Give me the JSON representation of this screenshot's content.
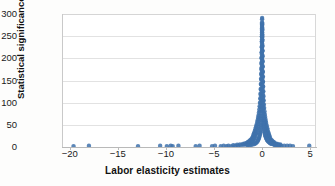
{
  "chart_data": {
    "type": "scatter",
    "title": "",
    "xlabel": "Labor elasticity estimates",
    "ylabel": "Statistical significance (1/Se)",
    "xlim": [
      -20.8,
      5.6
    ],
    "ylim": [
      0,
      300
    ],
    "xticks": [
      -20,
      -15,
      -10,
      -5,
      0,
      5
    ],
    "xticklabels": [
      "−20",
      "−15",
      "−10",
      "−5",
      "0",
      "5"
    ],
    "yticks": [
      0,
      50,
      100,
      150,
      200,
      250,
      300
    ],
    "yticklabels": [
      "0",
      "50",
      "100",
      "150",
      "200",
      "250",
      "300"
    ],
    "grid": "horizontal",
    "legend": "none",
    "marker_color": "#3f72ab",
    "marker_size": 2.2,
    "series": [
      {
        "name": "study estimates",
        "comment": "funnel plot: dense near-zero spike plus sparse negative outliers",
        "points": [
          [
            -19.6,
            2
          ],
          [
            -18.0,
            3
          ],
          [
            -12.9,
            2
          ],
          [
            -10.6,
            3
          ],
          [
            -9.9,
            2
          ],
          [
            -9.5,
            3
          ],
          [
            -9.3,
            2
          ],
          [
            -8.7,
            3
          ],
          [
            -6.9,
            2
          ],
          [
            -6.5,
            3
          ],
          [
            -5.2,
            2
          ],
          [
            -4.9,
            3
          ],
          [
            -4.3,
            2
          ],
          [
            -4.0,
            3
          ],
          [
            -3.7,
            2
          ],
          [
            -3.5,
            3
          ],
          [
            -3.2,
            2
          ],
          [
            -3.0,
            4
          ],
          [
            -2.8,
            3
          ],
          [
            -2.6,
            5
          ],
          [
            -2.5,
            3
          ],
          [
            -2.3,
            6
          ],
          [
            -2.2,
            4
          ],
          [
            -2.0,
            7
          ],
          [
            -1.9,
            5
          ],
          [
            -1.8,
            8
          ],
          [
            -1.7,
            6
          ],
          [
            -1.6,
            9
          ],
          [
            -1.55,
            5
          ],
          [
            -1.5,
            11
          ],
          [
            -1.45,
            7
          ],
          [
            -1.4,
            12
          ],
          [
            -1.35,
            8
          ],
          [
            -1.3,
            14
          ],
          [
            -1.25,
            9
          ],
          [
            -1.2,
            16
          ],
          [
            -1.15,
            10
          ],
          [
            -1.1,
            18
          ],
          [
            -1.05,
            12
          ],
          [
            -1.0,
            21
          ],
          [
            -0.97,
            14
          ],
          [
            -0.95,
            24
          ],
          [
            -0.92,
            16
          ],
          [
            -0.9,
            27
          ],
          [
            -0.87,
            18
          ],
          [
            -0.85,
            30
          ],
          [
            -0.82,
            20
          ],
          [
            -0.8,
            33
          ],
          [
            -0.78,
            22
          ],
          [
            -0.75,
            36
          ],
          [
            -0.72,
            25
          ],
          [
            -0.7,
            40
          ],
          [
            -0.68,
            28
          ],
          [
            -0.65,
            44
          ],
          [
            -0.62,
            31
          ],
          [
            -0.6,
            48
          ],
          [
            -0.58,
            34
          ],
          [
            -0.55,
            52
          ],
          [
            -0.52,
            38
          ],
          [
            -0.5,
            57
          ],
          [
            -0.48,
            42
          ],
          [
            -0.46,
            61
          ],
          [
            -0.44,
            46
          ],
          [
            -0.42,
            66
          ],
          [
            -0.4,
            52
          ],
          [
            -0.38,
            71
          ],
          [
            -0.36,
            57
          ],
          [
            -0.34,
            77
          ],
          [
            -0.32,
            63
          ],
          [
            -0.3,
            84
          ],
          [
            -0.28,
            70
          ],
          [
            -0.26,
            92
          ],
          [
            -0.24,
            80
          ],
          [
            -0.22,
            100
          ],
          [
            -0.2,
            90
          ],
          [
            -0.19,
            110
          ],
          [
            -0.18,
            99
          ],
          [
            -0.17,
            120
          ],
          [
            -0.16,
            108
          ],
          [
            -0.15,
            131
          ],
          [
            -0.14,
            118
          ],
          [
            -0.13,
            142
          ],
          [
            -0.12,
            129
          ],
          [
            -0.11,
            154
          ],
          [
            -0.1,
            141
          ],
          [
            -0.09,
            166
          ],
          [
            -0.085,
            152
          ],
          [
            -0.08,
            178
          ],
          [
            -0.075,
            163
          ],
          [
            -0.07,
            190
          ],
          [
            -0.065,
            175
          ],
          [
            -0.06,
            202
          ],
          [
            -0.055,
            188
          ],
          [
            -0.05,
            214
          ],
          [
            -0.045,
            200
          ],
          [
            -0.04,
            226
          ],
          [
            -0.035,
            212
          ],
          [
            -0.03,
            238
          ],
          [
            -0.025,
            225
          ],
          [
            -0.02,
            250
          ],
          [
            -0.018,
            237
          ],
          [
            -0.015,
            262
          ],
          [
            -0.012,
            249
          ],
          [
            -0.01,
            273
          ],
          [
            -0.008,
            258
          ],
          [
            -0.006,
            281
          ],
          [
            -0.004,
            268
          ],
          [
            -0.002,
            288
          ],
          [
            0.0,
            276
          ],
          [
            0.002,
            291
          ],
          [
            0.004,
            265
          ],
          [
            0.006,
            253
          ],
          [
            0.008,
            243
          ],
          [
            0.01,
            230
          ],
          [
            0.013,
            218
          ],
          [
            0.016,
            205
          ],
          [
            0.02,
            193
          ],
          [
            0.024,
            181
          ],
          [
            0.028,
            170
          ],
          [
            0.032,
            159
          ],
          [
            0.036,
            148
          ],
          [
            0.04,
            138
          ],
          [
            0.045,
            128
          ],
          [
            0.05,
            119
          ],
          [
            0.055,
            110
          ],
          [
            0.06,
            102
          ],
          [
            0.07,
            94
          ],
          [
            0.08,
            87
          ],
          [
            0.09,
            80
          ],
          [
            0.1,
            73
          ],
          [
            0.11,
            67
          ],
          [
            0.12,
            62
          ],
          [
            0.13,
            57
          ],
          [
            0.14,
            52
          ],
          [
            0.16,
            48
          ],
          [
            0.18,
            44
          ],
          [
            0.2,
            40
          ],
          [
            0.22,
            36
          ],
          [
            0.25,
            33
          ],
          [
            0.28,
            30
          ],
          [
            0.31,
            27
          ],
          [
            0.35,
            24
          ],
          [
            0.4,
            21
          ],
          [
            0.45,
            19
          ],
          [
            0.5,
            17
          ],
          [
            0.55,
            15
          ],
          [
            0.6,
            13
          ],
          [
            0.7,
            11
          ],
          [
            0.8,
            9
          ],
          [
            0.9,
            8
          ],
          [
            1.0,
            7
          ],
          [
            1.2,
            6
          ],
          [
            1.4,
            5
          ],
          [
            1.6,
            4
          ],
          [
            1.8,
            4
          ],
          [
            2.0,
            3
          ],
          [
            2.3,
            3
          ],
          [
            2.6,
            3
          ],
          [
            2.9,
            3
          ],
          [
            3.2,
            2
          ],
          [
            4.9,
            3
          ]
        ]
      }
    ]
  },
  "axes": {
    "x_label": "Labor elasticity estimates",
    "y_label": "Statistical significance (1/Se)"
  }
}
